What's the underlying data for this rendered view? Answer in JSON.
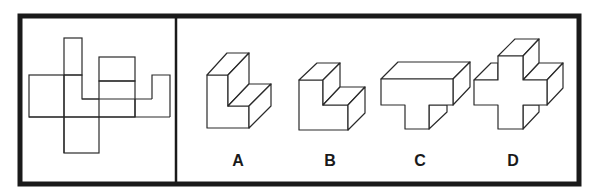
{
  "puzzle": {
    "type": "cube-net-folding",
    "net_panel": {
      "description": "Unfolded net of squares/rectangles"
    },
    "options": [
      {
        "label": "A",
        "shape": "L-shaped block (tall)"
      },
      {
        "label": "B",
        "shape": "L-shaped block (short)"
      },
      {
        "label": "C",
        "shape": "T-shaped block"
      },
      {
        "label": "D",
        "shape": "cross-shaped block"
      }
    ]
  },
  "colors": {
    "stroke": "#2a2a2a",
    "frame": "#1a1a1a",
    "background": "#ffffff"
  }
}
